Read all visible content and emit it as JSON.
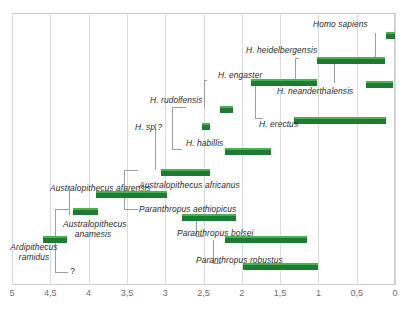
{
  "chart_data": {
    "type": "bar",
    "title": "",
    "xlabel": "",
    "ylabel": "",
    "xlim": [
      5,
      0
    ],
    "x_direction": "reversed",
    "grid": true,
    "legend": "none",
    "axis_tick_labels": [
      "5",
      "4,5",
      "4",
      "3,5",
      "3",
      "2,5",
      "2",
      "1,5",
      "1",
      "0,5",
      "0"
    ],
    "axis_tick_values": [
      5,
      4.5,
      4,
      3.5,
      3,
      2.5,
      2,
      1.5,
      1,
      0.5,
      0
    ],
    "units": "millions of years ago",
    "bar_color": "#1f7a34",
    "bar_highlight_color": "#4caf50",
    "grid_color": "#d9dde1",
    "connector_color": "#9aa0a6",
    "categories": [
      "Ardipithecus ramidus",
      "Australopithecus anamesis",
      "Australopithecus afarensis",
      "Australopithecus africanus",
      "Paranthropus aethiopicus",
      "Paranthropus bolsei",
      "Paranthropus robustus",
      "H. sp.?",
      "H. rudolfensis",
      "H. habillis",
      "H. engaster",
      "H. erectus",
      "H. heidelbergensis",
      "H. neanderthalensis",
      "Homo sapiens"
    ],
    "ranges": [
      {
        "name": "Ardipithecus ramidus",
        "start": 4.6,
        "end": 4.28
      },
      {
        "name": "Australopithecus anamesis",
        "start": 4.2,
        "end": 3.88
      },
      {
        "name": "Australopithecus afarensis",
        "start": 3.9,
        "end": 2.98
      },
      {
        "name": "Australopithecus africanus",
        "start": 3.05,
        "end": 2.42
      },
      {
        "name": "Paranthropus aethiopicus",
        "start": 2.78,
        "end": 2.08
      },
      {
        "name": "Paranthropus bolsei",
        "start": 2.22,
        "end": 1.15
      },
      {
        "name": "Paranthropus robustus",
        "start": 1.98,
        "end": 1.0
      },
      {
        "name": "H. sp.?",
        "start": 2.52,
        "end": 2.42
      },
      {
        "name": "H. rudolfensis",
        "start": 2.28,
        "end": 2.12
      },
      {
        "name": "H. habillis",
        "start": 2.22,
        "end": 1.62
      },
      {
        "name": "H. engaster",
        "start": 1.88,
        "end": 1.02
      },
      {
        "name": "H. erectus",
        "start": 1.32,
        "end": 0.12
      },
      {
        "name": "H. heidelbergensis",
        "start": 1.02,
        "end": 0.13
      },
      {
        "name": "H. neanderthalensis",
        "start": 0.38,
        "end": 0.02
      },
      {
        "name": "Homo sapiens",
        "start": 0.12,
        "end": 0.0
      }
    ],
    "annotations": [
      "?"
    ]
  },
  "labels": {
    "ardipithecus_ramidus": "Ardipithecus\nramidus",
    "ardipithecus_ramidus_l1": "Ardipithecus",
    "ardipithecus_ramidus_l2": "ramidus",
    "australopithecus_anamesis_l1": "Australopithecus",
    "australopithecus_anamesis_l2": "anamesis",
    "australopithecus_afarensis": "Australopithecus afarensis",
    "australopithecus_africanus": "Australopithecus africanus",
    "paranthropus_aethiopicus": "Paranthropus aethiopicus",
    "paranthropus_bolsei": "Paranthropus bolsei",
    "paranthropus_robustus": "Paranthropus robustus",
    "h_sp_q": "H. sp.?",
    "h_rudolfensis": "H. rudolfensis",
    "h_habillis": "H. habillis",
    "h_engaster": "H. engaster",
    "h_erectus": "H. erectus",
    "h_heidelbergensis": "H. heidelbergensis",
    "h_neanderthalensis": "H. neanderthalensis",
    "homo_sapiens": "Homo sapiens",
    "unknown_link": "?"
  }
}
